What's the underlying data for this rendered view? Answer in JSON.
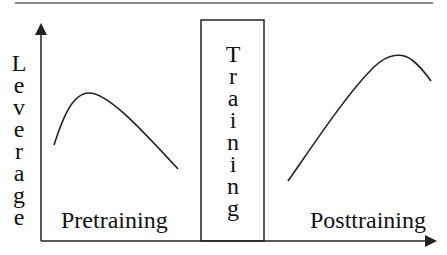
{
  "diagram": {
    "y_axis_label": "Leverage",
    "y_axis_letters": [
      "L",
      "e",
      "v",
      "e",
      "r",
      "a",
      "g",
      "e"
    ],
    "box_label": "Training",
    "box_letters": [
      "T",
      "r",
      "a",
      "i",
      "n",
      "i",
      "n",
      "g"
    ],
    "left_region_label": "Pretraining",
    "right_region_label": "Posttraining",
    "curves": [
      {
        "name": "pretraining-curve",
        "shape": "rise-then-fall",
        "start": [
          54,
          145
        ],
        "peak": [
          89,
          93
        ],
        "end": [
          178,
          169
        ]
      },
      {
        "name": "posttraining-curve",
        "shape": "rise-then-fall",
        "start": [
          288,
          181
        ],
        "peak": [
          398,
          55
        ],
        "end": [
          431,
          81
        ]
      }
    ],
    "colors": {
      "line": "#222222",
      "rule": "#8a8a8a",
      "background": "#ffffff"
    }
  }
}
